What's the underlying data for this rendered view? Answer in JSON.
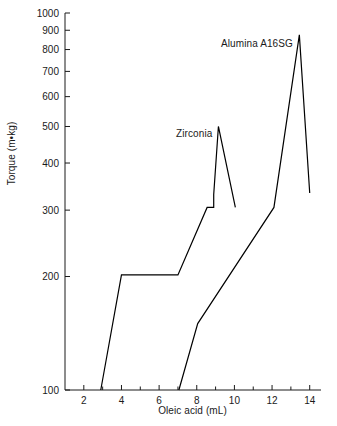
{
  "figure": {
    "background": "#ffffff",
    "line_color": "#000000",
    "text_color": "#1a1a1a"
  },
  "chart_data": {
    "type": "line",
    "title": "",
    "xlabel": "Oleic acid (mL)",
    "ylabel": "Torque (m•kg)",
    "xlim": [
      1,
      14.6
    ],
    "ylim": [
      100,
      1000
    ],
    "yscale": "log",
    "xscale": "linear",
    "grid": false,
    "legend": "inline-annotations",
    "xticks": [
      2,
      4,
      6,
      8,
      10,
      12,
      14
    ],
    "xtick_labels": [
      "2",
      "4",
      "6",
      "8",
      "10",
      "12",
      "14"
    ],
    "xminor_ticks": [
      3,
      5,
      7,
      9,
      11,
      13
    ],
    "yticks": [
      100,
      200,
      300,
      400,
      500,
      600,
      700,
      800,
      900,
      1000
    ],
    "ytick_labels": [
      "100",
      "200",
      "300",
      "400",
      "500",
      "600",
      "700",
      "800",
      "900",
      "1000"
    ],
    "series": [
      {
        "name": "Zirconia",
        "label_x": 8.2,
        "label_y": 455,
        "x": [
          2.9,
          4.0,
          7.0,
          8.55,
          8.9,
          8.9,
          9.15,
          10.05
        ],
        "y": [
          100,
          202,
          202,
          305,
          305,
          330,
          500,
          305
        ]
      },
      {
        "name": "Alumina A16SG",
        "label_x": 11.1,
        "label_y": 810,
        "x": [
          7.05,
          8.05,
          12.1,
          13.45,
          14.0
        ],
        "y": [
          100,
          150,
          305,
          875,
          333
        ]
      }
    ],
    "annotations": [
      {
        "text": "Zirconia",
        "x": 8.2,
        "y": 455
      },
      {
        "text": "Alumina A16SG",
        "x": 11.1,
        "y": 810
      }
    ]
  }
}
